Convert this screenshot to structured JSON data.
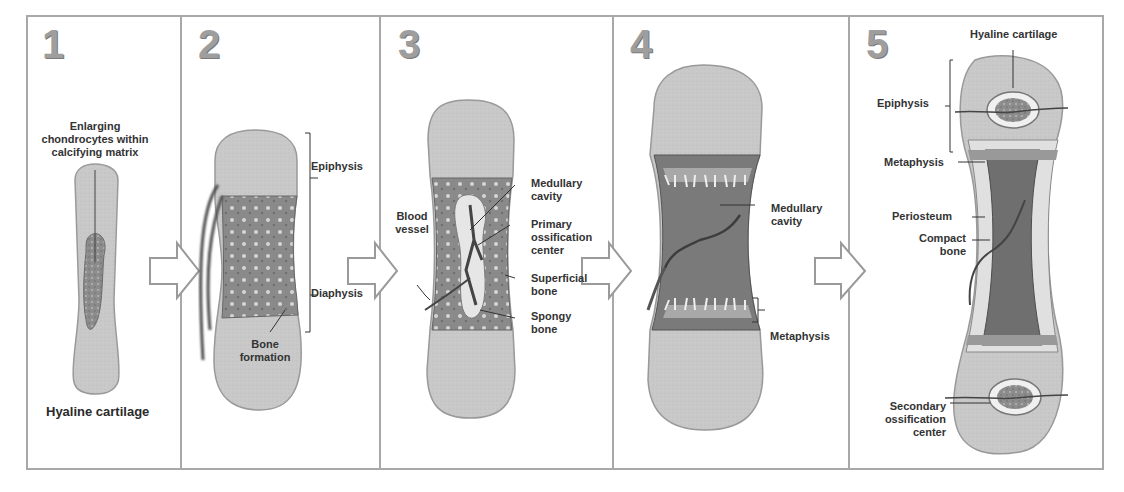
{
  "panels": [
    {
      "number": "1",
      "labels": {
        "chondrocytes": "Enlarging chondrocytes within calcifying matrix",
        "chondrocytes_l1": "Enlarging",
        "chondrocytes_l2": "chondrocytes within",
        "chondrocytes_l3": "calcifying matrix",
        "hyaline": "Hyaline cartilage"
      }
    },
    {
      "number": "2",
      "labels": {
        "epiphysis": "Epiphysis",
        "diaphysis": "Diaphysis",
        "bone_formation_l1": "Bone",
        "bone_formation_l2": "formation"
      }
    },
    {
      "number": "3",
      "labels": {
        "blood_vessel_l1": "Blood",
        "blood_vessel_l2": "vessel",
        "medullary_l1": "Medullary",
        "medullary_l2": "cavity",
        "primary_l1": "Primary",
        "primary_l2": "ossification",
        "primary_l3": "center",
        "superficial_l1": "Superficial",
        "superficial_l2": "bone",
        "spongy_l1": "Spongy",
        "spongy_l2": "bone"
      }
    },
    {
      "number": "4",
      "labels": {
        "medullary_l1": "Medullary",
        "medullary_l2": "cavity",
        "metaphysis": "Metaphysis"
      }
    },
    {
      "number": "5",
      "labels": {
        "hyaline": "Hyaline cartilage",
        "epiphysis": "Epiphysis",
        "metaphysis": "Metaphysis",
        "periosteum": "Periosteum",
        "compact_l1": "Compact",
        "compact_l2": "bone",
        "secondary_l1": "Secondary",
        "secondary_l2": "ossification",
        "secondary_l3": "center"
      }
    }
  ],
  "arrows": [
    "1 to 2",
    "2 to 3",
    "3 to 4",
    "4 to 5"
  ],
  "colors": {
    "border": "#a8a8a8",
    "cartilage": "#c8c8c8",
    "bone": "#8f8f8f",
    "vessel": "#555555",
    "text": "#333333"
  }
}
